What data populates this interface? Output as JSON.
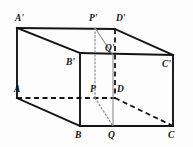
{
  "figure": {
    "type": "geometry-diagram",
    "canvas": {
      "width": 193,
      "height": 147
    },
    "colors": {
      "background": "#fdfdfd",
      "solid_edge": "#141414",
      "hidden_edge": "#141414",
      "thin_line": "#8c8c8c",
      "label_text": "#141414"
    },
    "vertices": [
      {
        "id": "A-prime",
        "label": "A'",
        "x": 17,
        "y": 28,
        "label_x": 15,
        "label_y": 14,
        "hidden": false
      },
      {
        "id": "P-prime",
        "label": "P'",
        "x": 95,
        "y": 28,
        "label_x": 89,
        "label_y": 14,
        "hidden": false
      },
      {
        "id": "D-prime",
        "label": "D'",
        "x": 115,
        "y": 29,
        "label_x": 116,
        "label_y": 14,
        "hidden": false
      },
      {
        "id": "C-prime",
        "label": "C'",
        "x": 173,
        "y": 55,
        "label_x": 162,
        "label_y": 60,
        "hidden": false
      },
      {
        "id": "B-prime",
        "label": "B'",
        "x": 80,
        "y": 53,
        "label_x": 66,
        "label_y": 58,
        "hidden": false
      },
      {
        "id": "Q-prime",
        "label": "Q'",
        "x": 113,
        "y": 55,
        "label_x": 105,
        "label_y": 44,
        "hidden": true
      },
      {
        "id": "A",
        "label": "A",
        "x": 17,
        "y": 98,
        "label_x": 14,
        "label_y": 85,
        "hidden": false
      },
      {
        "id": "P",
        "label": "P",
        "x": 95,
        "y": 98,
        "label_x": 90,
        "label_y": 85,
        "hidden": true
      },
      {
        "id": "D",
        "label": "D",
        "x": 115,
        "y": 98,
        "label_x": 117,
        "label_y": 85,
        "hidden": true
      },
      {
        "id": "B",
        "label": "B",
        "x": 80,
        "y": 126,
        "label_x": 75,
        "label_y": 131,
        "hidden": false
      },
      {
        "id": "Q",
        "label": "Q",
        "x": 113,
        "y": 126,
        "label_x": 108,
        "label_y": 131,
        "hidden": false
      },
      {
        "id": "C",
        "label": "C",
        "x": 173,
        "y": 126,
        "label_x": 168,
        "label_y": 131,
        "hidden": false
      }
    ],
    "solid_edges": [
      {
        "id": "edge-Ap-Dp",
        "from": "A-prime",
        "to": "D-prime"
      },
      {
        "id": "edge-Dp-Cp",
        "from": "D-prime",
        "to": "C-prime"
      },
      {
        "id": "edge-Ap-Bp",
        "from": "A-prime",
        "to": "B-prime"
      },
      {
        "id": "edge-Bp-Cp",
        "from": "B-prime",
        "to": "C-prime"
      },
      {
        "id": "edge-Ap-A",
        "from": "A-prime",
        "to": "A"
      },
      {
        "id": "edge-Bp-B",
        "from": "B-prime",
        "to": "B"
      },
      {
        "id": "edge-Cp-C",
        "from": "C-prime",
        "to": "C"
      },
      {
        "id": "edge-A-B",
        "from": "A",
        "to": "B"
      },
      {
        "id": "edge-B-C",
        "from": "B",
        "to": "C"
      }
    ],
    "hidden_edges": [
      {
        "id": "edge-A-D",
        "from": "A",
        "to": "D"
      },
      {
        "id": "edge-D-C",
        "from": "D",
        "to": "C"
      },
      {
        "id": "edge-Dp-D",
        "from": "D-prime",
        "to": "D"
      }
    ],
    "construction_lines": [
      {
        "id": "line-Pp-Qp",
        "from": "P-prime",
        "to": "Q-prime",
        "style": "thin-solid"
      },
      {
        "id": "line-Qp-Q",
        "from": "Q-prime",
        "to": "Q",
        "style": "thin-solid"
      },
      {
        "id": "line-Pp-P",
        "from": "P-prime",
        "to": "P",
        "style": "dotted"
      },
      {
        "id": "line-P-Q",
        "from": "P",
        "to": "Q",
        "style": "dotted"
      }
    ]
  }
}
